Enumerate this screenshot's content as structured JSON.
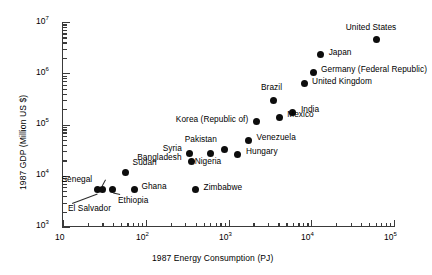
{
  "chart_data": {
    "type": "scatter",
    "title": "",
    "xlabel": "1987 Energy Consumption (PJ)",
    "ylabel": "1987 GDP (Million US $)",
    "xscale": "log",
    "yscale": "log",
    "xlim": [
      10,
      100000
    ],
    "ylim": [
      1000,
      10000000
    ],
    "xticklabels": [
      "10",
      "10²",
      "10³",
      "10⁴",
      "10⁵"
    ],
    "yticklabels": [
      "10³",
      "10⁴",
      "10⁵",
      "10⁶",
      "10⁷"
    ],
    "grid": false,
    "legend": false,
    "marker_color": "#0d0d0d",
    "points": [
      {
        "label": "United States",
        "x": 62000,
        "y": 4500000
      },
      {
        "label": "Japan",
        "x": 13000,
        "y": 2300000
      },
      {
        "label": "Germany (Federal Republic)",
        "x": 10500,
        "y": 1050000
      },
      {
        "label": "United Kingdom",
        "x": 8200,
        "y": 620000
      },
      {
        "label": "Brazil",
        "x": 3500,
        "y": 300000
      },
      {
        "label": "India",
        "x": 6000,
        "y": 175000
      },
      {
        "label": "Mexico",
        "x": 4100,
        "y": 140000
      },
      {
        "label": "Korea (Republic of)",
        "x": 2200,
        "y": 113000
      },
      {
        "label": "Venezuela",
        "x": 1750,
        "y": 49000
      },
      {
        "label": "Pakistan",
        "x": 900,
        "y": 33000
      },
      {
        "label": "Hungary",
        "x": 1300,
        "y": 26000
      },
      {
        "label": "Syria",
        "x": 340,
        "y": 27000
      },
      {
        "label": "Nigeria",
        "x": 600,
        "y": 27000
      },
      {
        "label": "Bangladesh",
        "x": 355,
        "y": 19000
      },
      {
        "label": "Sudan",
        "x": 57,
        "y": 11500
      },
      {
        "label": "Senegal",
        "x": 30,
        "y": 5400
      },
      {
        "label": "El Salvador",
        "x": 26,
        "y": 5400
      },
      {
        "label": "Ethiopia",
        "x": 40,
        "y": 5400
      },
      {
        "label": "Ghana",
        "x": 73,
        "y": 5400
      },
      {
        "label": "Zimbabwe",
        "x": 400,
        "y": 5300
      }
    ]
  },
  "axes": {
    "y_axis_label": "1987 GDP (Million US $)",
    "x_axis_label": "1987 Energy Consumption (PJ)",
    "y_ticks": [
      {
        "label": "10",
        "exp": "7"
      },
      {
        "label": "10",
        "exp": "6"
      },
      {
        "label": "10",
        "exp": "5"
      },
      {
        "label": "10",
        "exp": "4"
      },
      {
        "label": "10",
        "exp": "3"
      }
    ],
    "x_ticks": [
      {
        "label": "10",
        "exp": ""
      },
      {
        "label": "10",
        "exp": "2"
      },
      {
        "label": "10",
        "exp": "3"
      },
      {
        "label": "10",
        "exp": "4"
      },
      {
        "label": "10",
        "exp": "5"
      }
    ]
  },
  "labels": {
    "united_states": "United States",
    "japan": "Japan",
    "germany": "Germany (Federal Republic)",
    "united_kingdom": "United Kingdom",
    "brazil": "Brazil",
    "india": "India",
    "mexico": "Mexico",
    "korea": "Korea (Republic of)",
    "venezuela": "Venezuela",
    "pakistan": "Pakistan",
    "hungary": "Hungary",
    "syria": "Syria",
    "nigeria": "Nigeria",
    "bangladesh": "Bangladesh",
    "sudan": "Sudan",
    "senegal": "Senegal",
    "el_salvador": "El Salvador",
    "ethiopia": "Ethiopia",
    "ghana": "Ghana",
    "zimbabwe": "Zimbabwe"
  }
}
